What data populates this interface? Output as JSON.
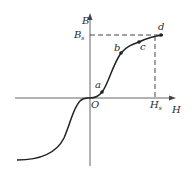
{
  "diagram": {
    "type": "magnetization-curve",
    "axes": {
      "x_label": "H",
      "y_label": "B",
      "origin_label": "O"
    },
    "saturation": {
      "B_label": "B",
      "B_sub": "s",
      "H_label": "H",
      "H_sub": "s"
    },
    "points": [
      {
        "label": "a"
      },
      {
        "label": "b"
      },
      {
        "label": "c"
      },
      {
        "label": "d"
      }
    ],
    "colors": {
      "curve": "#222222",
      "axis": "#444444",
      "dash": "#333333"
    }
  }
}
